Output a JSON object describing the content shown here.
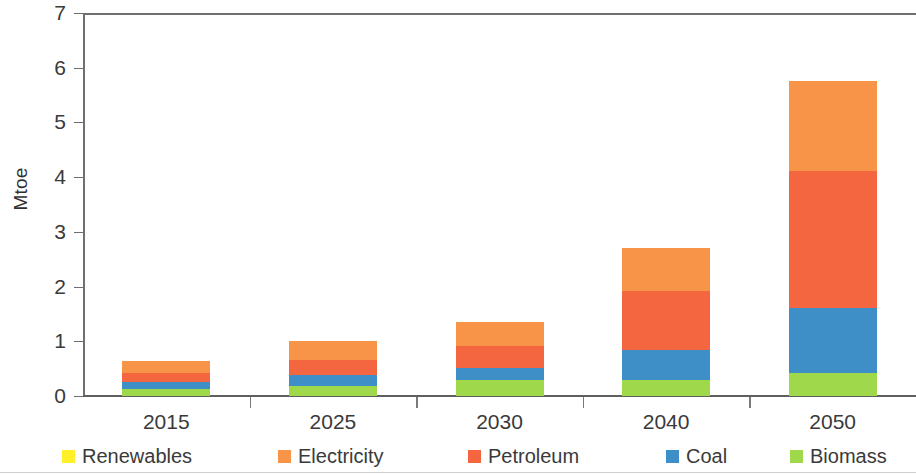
{
  "chart_data": {
    "type": "bar",
    "stacked": true,
    "title": "",
    "xlabel": "",
    "ylabel": "Mtoe",
    "ylim": [
      0,
      7
    ],
    "ytick_labels": [
      "0",
      "1",
      "2",
      "3",
      "4",
      "5",
      "6",
      "7"
    ],
    "grid": false,
    "legend_position": "bottom",
    "categories": [
      "2015",
      "2025",
      "2030",
      "2040",
      "2050"
    ],
    "series": [
      {
        "name": "Renewables",
        "color": "#FFF02A",
        "values": [
          0.0,
          0.0,
          0.0,
          0.0,
          0.0
        ]
      },
      {
        "name": "Electricity",
        "color": "#F89447",
        "values": [
          0.22,
          0.35,
          0.43,
          0.78,
          1.65
        ]
      },
      {
        "name": "Petroleum",
        "color": "#F4663F",
        "values": [
          0.16,
          0.27,
          0.4,
          1.08,
          2.5
        ]
      },
      {
        "name": "Coal",
        "color": "#3E8FC8",
        "values": [
          0.13,
          0.19,
          0.23,
          0.55,
          1.19
        ]
      },
      {
        "name": "Biomass",
        "color": "#9FD84A",
        "values": [
          0.13,
          0.19,
          0.29,
          0.29,
          0.42
        ]
      }
    ],
    "totals": [
      0.64,
      1.0,
      1.35,
      2.7,
      5.76
    ],
    "stack_order_bottom_to_top": [
      "Biomass",
      "Coal",
      "Petroleum",
      "Electricity",
      "Renewables"
    ]
  },
  "legend": {
    "items": [
      {
        "label": "Renewables",
        "color": "#FFF02A"
      },
      {
        "label": "Electricity",
        "color": "#F89447"
      },
      {
        "label": "Petroleum",
        "color": "#F4663F"
      },
      {
        "label": "Coal",
        "color": "#3E8FC8"
      },
      {
        "label": "Biomass",
        "color": "#9FD84A"
      }
    ]
  }
}
